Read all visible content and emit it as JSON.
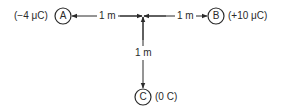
{
  "diagram": {
    "nodes": [
      {
        "id": "A",
        "letter": "A",
        "charge": "(−4 μC)"
      },
      {
        "id": "B",
        "letter": "B",
        "charge": "(+10 μC)"
      },
      {
        "id": "C",
        "letter": "C",
        "charge": "(0 C)"
      }
    ],
    "distances": [
      {
        "from": "junction",
        "to": "A",
        "label": "1 m"
      },
      {
        "from": "junction",
        "to": "B",
        "label": "1 m"
      },
      {
        "from": "junction",
        "to": "C",
        "label": "1 m"
      }
    ],
    "colors": {
      "line": "#2a2a2a",
      "background": "#ffffff"
    }
  }
}
